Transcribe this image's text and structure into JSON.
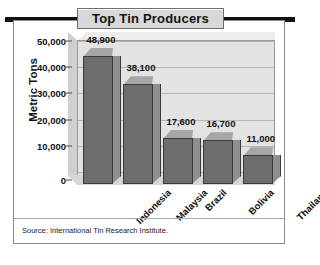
{
  "card": {
    "title": "Top Tin Producers",
    "source": "Source: International Tin Research Institute."
  },
  "chart_data": {
    "type": "bar",
    "title": "Top Tin Producers",
    "xlabel": "",
    "ylabel": "Metric Tons",
    "categories": [
      "Indonesia",
      "Malaysia",
      "Brazil",
      "Bolivia",
      "Thailand"
    ],
    "values": [
      48900,
      38100,
      17600,
      16700,
      11000
    ],
    "value_labels": [
      "48,900",
      "38,100",
      "17,600",
      "16,700",
      "11,000"
    ],
    "ylim": [
      0,
      55000
    ],
    "yticks": [
      0,
      10000,
      20000,
      30000,
      40000,
      50000
    ],
    "ytick_labels": [
      "0",
      "10,000",
      "20,000",
      "30,000",
      "40,000",
      "50,000"
    ],
    "grid": true,
    "legend": "none",
    "style": "3d-column",
    "source": "Source: International Tin Research Institute.",
    "colors": {
      "bar_front": "#6d6d6d",
      "bar_side": "#8f8f8f",
      "bar_top": "#a6a6a6",
      "wall": "#e3e3e3",
      "grid": "#b4b4b4",
      "title_plaque": "#d8d8d8",
      "rule": "#111111",
      "text": "#111111"
    }
  }
}
